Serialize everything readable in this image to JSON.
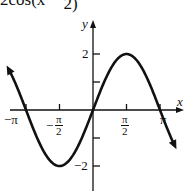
{
  "chart_data": {
    "type": "line",
    "function": "y = 2cos(x - pi/2)",
    "xlabel": "x",
    "ylabel": "y",
    "xlim": [
      -4.08,
      3.95
    ],
    "ylim": [
      -3.4,
      4.2
    ],
    "x_ticks": [
      {
        "value": -3.1416,
        "label": "−π"
      },
      {
        "value": -1.5708,
        "label": "−π/2"
      },
      {
        "value": 1.5708,
        "label": "π/2"
      },
      {
        "value": 3.1416,
        "label": "π"
      }
    ],
    "y_ticks": [
      {
        "value": 2,
        "label": "2"
      },
      {
        "value": 1,
        "label": ""
      },
      {
        "value": -1,
        "label": ""
      },
      {
        "value": -2,
        "label": "−2"
      }
    ],
    "key_points": [
      {
        "x": -3.1416,
        "y": 0
      },
      {
        "x": -1.5708,
        "y": 2
      },
      {
        "x": 0,
        "y": 0
      },
      {
        "x": 1.5708,
        "y": -2
      },
      {
        "x": 3.1416,
        "y": 0
      }
    ],
    "grid": false,
    "legend": null
  },
  "labels": {
    "title_text": "2cos(x − ",
    "title_frac_den": "2)",
    "x_axis": "x",
    "y_axis": "y",
    "neg_pi": "−π",
    "pi": "π",
    "pi_num": "π",
    "two_den": "2",
    "neg_sign": "−",
    "y_two": "2",
    "y_neg_two": "−2"
  },
  "colors": {
    "curve": "#111111",
    "axes": "#111111",
    "background": "#ffffff"
  }
}
